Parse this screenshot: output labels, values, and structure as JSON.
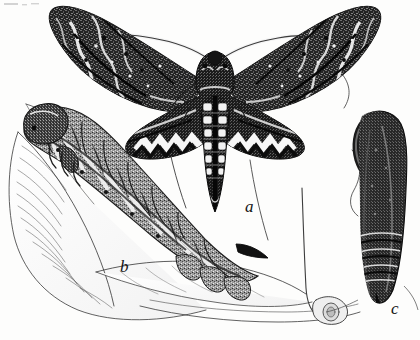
{
  "plate": {
    "medium": "engraving",
    "palette": {
      "paper": "#fdfdfc",
      "ink": "#141414",
      "ink_mid": "#4a4a4a",
      "ink_light": "#8a8a8a",
      "highlight": "#ffffff"
    },
    "background_color": "#fdfdfc",
    "width": 420,
    "height": 340
  },
  "figure_labels": [
    {
      "id": "a",
      "text": "a",
      "subject": "adult-moth",
      "x": 245,
      "y": 198
    },
    {
      "id": "b",
      "text": "b",
      "subject": "larva-caterpillar",
      "x": 120,
      "y": 258
    },
    {
      "id": "c",
      "text": "c",
      "subject": "pupa",
      "x": 391,
      "y": 300
    }
  ],
  "subjects": {
    "moth": {
      "name": "adult-moth",
      "label": "a",
      "forewing_pattern": "mottled-zigzag",
      "abdomen_spot_pairs": 6,
      "antennae": 2,
      "wings": 4
    },
    "larva": {
      "name": "larva-caterpillar",
      "label": "b",
      "segments": 8,
      "has_caudal_horn": true,
      "prolegs": 4
    },
    "pupa": {
      "name": "pupa",
      "label": "c",
      "has_tongue_case_handle": true
    },
    "foliage": {
      "name": "foliage-leaves",
      "leaf_count": 3,
      "stem_count": 3
    }
  }
}
